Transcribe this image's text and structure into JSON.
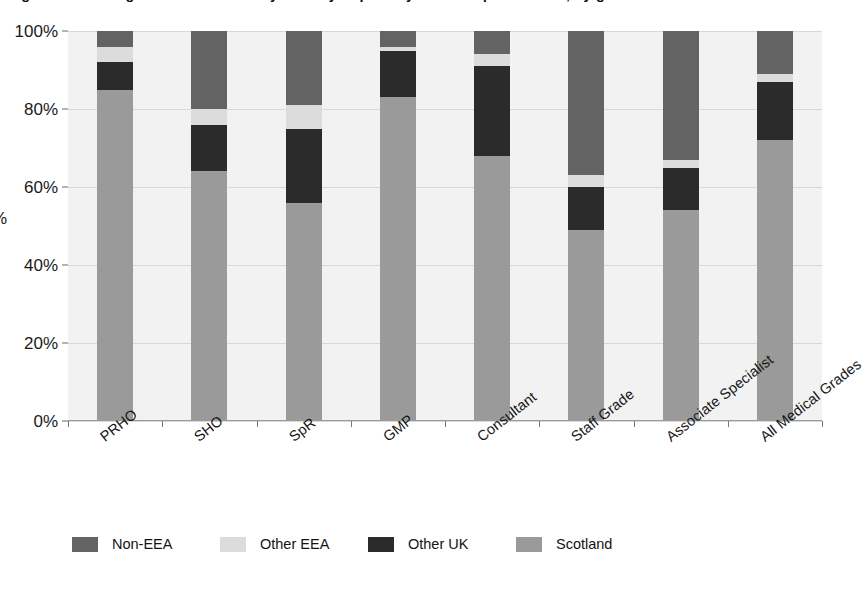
{
  "chart_data": {
    "type": "bar",
    "subtype": "stacked-percentage-column",
    "title": "Figure: Percentage of medical staff by country of primary medical qualification, by grade",
    "xlabel": "",
    "ylabel": "%",
    "ylim": [
      0,
      100
    ],
    "yticks": [
      "0%",
      "20%",
      "40%",
      "60%",
      "80%",
      "100%"
    ],
    "ytick_values": [
      0,
      20,
      40,
      60,
      80,
      100
    ],
    "grid": true,
    "legend_position": "bottom-left",
    "stack_order_bottom_to_top": [
      "Scotland",
      "Other UK",
      "Other EEA",
      "Non-EEA"
    ],
    "categories": [
      "PRHO",
      "SHO",
      "SpR",
      "GMP",
      "Consultant",
      "Staff Grade",
      "Associate Specialist",
      "All Medical Grades"
    ],
    "series": [
      {
        "name": "Scotland",
        "color": "#9a9a9a",
        "values": [
          85,
          64,
          56,
          83,
          68,
          49,
          54,
          72
        ]
      },
      {
        "name": "Other UK",
        "color": "#2b2b2b",
        "values": [
          7,
          12,
          19,
          12,
          23,
          11,
          11,
          15
        ]
      },
      {
        "name": "Other EEA",
        "color": "#dcdcdc",
        "values": [
          4,
          4,
          6,
          1,
          3,
          3,
          2,
          2
        ]
      },
      {
        "name": "Non-EEA",
        "color": "#636363",
        "values": [
          4,
          20,
          19,
          4,
          6,
          37,
          33,
          11
        ]
      }
    ]
  },
  "legend": {
    "items": [
      {
        "label": "Non-EEA",
        "color": "#636363"
      },
      {
        "label": "Other EEA",
        "color": "#dcdcdc"
      },
      {
        "label": "Other UK",
        "color": "#2b2b2b"
      },
      {
        "label": "Scotland",
        "color": "#9a9a9a"
      }
    ]
  },
  "colors": {
    "plot_background": "#f2f2f2",
    "gridline": "#d8d8d8",
    "axis": "#8f8f8f",
    "text": "#1a1a1a"
  }
}
